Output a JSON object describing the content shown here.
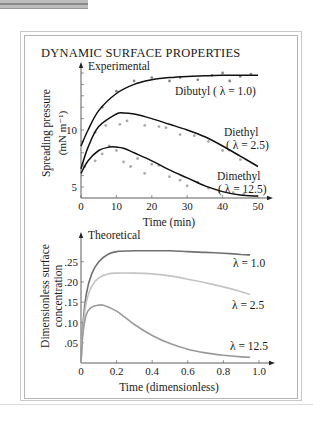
{
  "figure": {
    "title": "DYNAMIC SURFACE PROPERTIES"
  },
  "chart_data": [
    {
      "type": "scatter",
      "panel_label": "Experimental",
      "title": "DYNAMIC SURFACE PROPERTIES",
      "xlabel": "Time (min)",
      "ylabel": "Spreading pressure (mN m⁻¹)",
      "ylabel_line1": "Spreading pressure",
      "ylabel_line2": "(mN m⁻¹)",
      "xlim": [
        0,
        50
      ],
      "ylim": [
        4,
        15.5
      ],
      "x_ticks": [
        0,
        10,
        20,
        30,
        40,
        50
      ],
      "x_tick_labels": [
        "0",
        "10",
        "20",
        "30",
        "40",
        "50"
      ],
      "y_ticks": [
        5,
        10
      ],
      "y_tick_labels": [
        "5",
        "10"
      ],
      "grid": false,
      "series": [
        {
          "name": "Dibutyl",
          "label_line1": "Dibutyl ( λ = 1.0)",
          "lambda": 1.0,
          "curve": {
            "x": [
              0,
              2,
              5,
              10,
              15,
              20,
              25,
              30,
              35,
              40,
              45,
              50
            ],
            "y": [
              8.6,
              10.0,
              11.7,
              13.2,
              14.0,
              14.4,
              14.6,
              14.7,
              14.75,
              14.8,
              14.8,
              14.8
            ]
          },
          "points": {
            "x": [
              6,
              10,
              15,
              20,
              25,
              28,
              33,
              37,
              40,
              42,
              45,
              48
            ],
            "y": [
              12.0,
              13.4,
              14.3,
              14.6,
              14.3,
              14.6,
              14.4,
              14.8,
              15.0,
              14.3,
              14.7,
              14.9
            ]
          }
        },
        {
          "name": "Diethyl",
          "label_line1": "Diethyl",
          "label_line2": "( λ = 2.5)",
          "lambda": 2.5,
          "curve": {
            "x": [
              0,
              2,
              5,
              10,
              12,
              15,
              20,
              25,
              30,
              35,
              40,
              45,
              50
            ],
            "y": [
              6.6,
              8.5,
              10.3,
              11.4,
              11.5,
              11.4,
              11.0,
              10.5,
              10.0,
              9.4,
              8.6,
              7.7,
              6.8
            ]
          },
          "points": {
            "x": [
              1,
              4,
              7,
              11,
              13,
              18,
              22,
              24,
              28,
              32,
              36,
              40,
              45
            ],
            "y": [
              6.8,
              9.8,
              10.4,
              10.5,
              10.8,
              10.4,
              10.3,
              10.2,
              9.6,
              9.5,
              9.0,
              8.2,
              7.4
            ]
          }
        },
        {
          "name": "Dimethyl",
          "label_line1": "Dimethyl",
          "label_line2": "( λ = 12.5)",
          "lambda": 12.5,
          "curve": {
            "x": [
              0,
              2,
              5,
              8,
              10,
              12,
              15,
              20,
              25,
              30,
              35,
              40,
              45,
              50
            ],
            "y": [
              6.2,
              7.3,
              8.2,
              8.5,
              8.5,
              8.4,
              8.0,
              7.3,
              6.5,
              5.8,
              5.1,
              4.6,
              4.3,
              4.2
            ]
          },
          "points": {
            "x": [
              -8,
              -6,
              1,
              4,
              6,
              8,
              10,
              12,
              14,
              16,
              18,
              20,
              22,
              25,
              28,
              30,
              33,
              36,
              39,
              43,
              46
            ],
            "y": [
              6.5,
              8.1,
              6.8,
              7.3,
              7.9,
              8.6,
              8.2,
              7.2,
              6.8,
              7.5,
              6.2,
              7.0,
              6.9,
              5.9,
              5.6,
              5.1,
              5.4,
              4.9,
              4.6,
              4.5,
              4.4
            ]
          }
        }
      ]
    },
    {
      "type": "line",
      "panel_label": "Theoretical",
      "xlabel": "Time (dimensionless)",
      "ylabel": "Dimensionless surface concentration",
      "ylabel_line1": "Dimensionless surface",
      "ylabel_line2": "concentration",
      "xlim": [
        0,
        1.05
      ],
      "ylim": [
        0,
        0.3
      ],
      "x_ticks": [
        0,
        0.2,
        0.4,
        0.6,
        0.8,
        1.0
      ],
      "x_tick_labels": [
        "0",
        "0.2",
        "0.4",
        "0.6",
        "0.8",
        "1.0"
      ],
      "y_ticks": [
        0.05,
        0.1,
        0.15,
        0.2,
        0.25
      ],
      "y_tick_labels": [
        ".05",
        ".10",
        ".15",
        ".20",
        ".25"
      ],
      "grid": false,
      "series": [
        {
          "name": "λ = 1.0",
          "lambda": 1.0,
          "color": "#707070",
          "x": [
            0,
            0.01,
            0.03,
            0.06,
            0.1,
            0.15,
            0.2,
            0.3,
            0.4,
            0.5,
            0.6,
            0.7,
            0.8,
            0.9,
            0.95
          ],
          "y": [
            0,
            0.09,
            0.17,
            0.22,
            0.25,
            0.268,
            0.275,
            0.277,
            0.277,
            0.277,
            0.275,
            0.273,
            0.271,
            0.268,
            0.267
          ]
        },
        {
          "name": "λ = 2.5",
          "lambda": 2.5,
          "color": "#c4c4c4",
          "x": [
            0,
            0.01,
            0.03,
            0.06,
            0.1,
            0.15,
            0.2,
            0.3,
            0.4,
            0.5,
            0.6,
            0.7,
            0.8,
            0.9,
            0.95
          ],
          "y": [
            0,
            0.08,
            0.15,
            0.19,
            0.21,
            0.22,
            0.222,
            0.222,
            0.22,
            0.215,
            0.207,
            0.198,
            0.188,
            0.176,
            0.169
          ]
        },
        {
          "name": "λ = 12.5",
          "lambda": 12.5,
          "color": "#9a9a9a",
          "x": [
            0,
            0.01,
            0.03,
            0.06,
            0.1,
            0.13,
            0.2,
            0.3,
            0.4,
            0.5,
            0.6,
            0.7,
            0.8,
            0.9,
            0.95
          ],
          "y": [
            0,
            0.07,
            0.12,
            0.138,
            0.143,
            0.142,
            0.128,
            0.095,
            0.068,
            0.048,
            0.034,
            0.025,
            0.019,
            0.015,
            0.014
          ]
        }
      ]
    }
  ]
}
